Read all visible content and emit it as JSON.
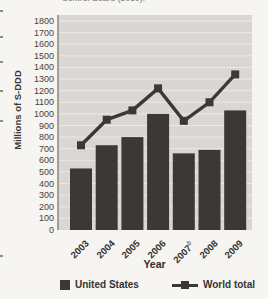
{
  "figure": {
    "top_clipped_caption": "Control Board (2010)."
  },
  "chart_data": {
    "type": "bar",
    "subtype": "bar-and-line combo",
    "categories": [
      "2003",
      "2004",
      "2005",
      "2006",
      "2007",
      "2008",
      "2009"
    ],
    "category_superscripts": [
      "",
      "",
      "",
      "",
      "b",
      "",
      ""
    ],
    "series": [
      {
        "name": "United States",
        "type": "bar",
        "values": [
          530,
          730,
          800,
          1000,
          660,
          690,
          1030
        ]
      },
      {
        "name": "World total",
        "type": "line",
        "values": [
          730,
          950,
          1030,
          1220,
          940,
          1100,
          1340
        ]
      }
    ],
    "xlabel": "Year",
    "ylabel": "Millions of S-DDD",
    "ylim": [
      0,
      1800
    ],
    "ytick_step": 100,
    "ytick_labels": [
      "1800",
      "1700",
      "1600",
      "1500",
      "1400",
      "1300",
      "1200",
      "1100",
      "1000",
      "900",
      "800",
      "700",
      "600",
      "500",
      "400",
      "300",
      "200",
      "100",
      "0"
    ],
    "grid": true,
    "legend_position": "bottom",
    "colors": {
      "bar": "#3b3835",
      "line": "#3b3835",
      "marker": "#3b3835",
      "plot_bg": "#d8d7d3",
      "gridline": "#eae9e5",
      "axis_line": "#a09e99",
      "text": "#35332f"
    }
  }
}
